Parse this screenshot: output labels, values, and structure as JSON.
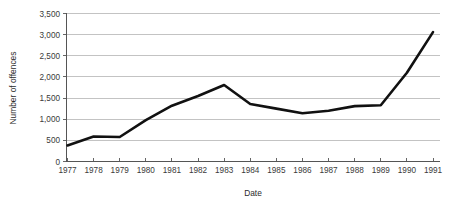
{
  "chart_data": {
    "type": "line",
    "title": "",
    "xlabel": "Date",
    "ylabel": "Number of offences",
    "categories": [
      "1977",
      "1978",
      "1979",
      "1980",
      "1981",
      "1982",
      "1983",
      "1984",
      "1985",
      "1986",
      "1987",
      "1988",
      "1989",
      "1990",
      "1991"
    ],
    "values": [
      380,
      590,
      580,
      980,
      1320,
      1550,
      1810,
      1360,
      1250,
      1140,
      1200,
      1310,
      1330,
      2100,
      3060
    ],
    "series": [
      {
        "name": "Number of offences",
        "values": [
          380,
          590,
          580,
          980,
          1320,
          1550,
          1810,
          1360,
          1250,
          1140,
          1200,
          1310,
          1330,
          2100,
          3060
        ]
      }
    ],
    "ylim": [
      0,
      3500
    ],
    "ytick_values": [
      0,
      500,
      1000,
      1500,
      2000,
      2500,
      3000,
      3500
    ],
    "ytick_labels": [
      "0",
      "500",
      "1,000",
      "1,500",
      "2,000",
      "2,500",
      "3,000",
      "3,500"
    ],
    "xtick_labels": [
      "1977",
      "1978",
      "1979",
      "1980",
      "1981",
      "1982",
      "1983",
      "1984",
      "1985",
      "1986",
      "1987",
      "1988",
      "1989",
      "1990",
      "1991"
    ],
    "grid": true,
    "grid_orientation": "horizontal",
    "legend": false,
    "legend_position": "none",
    "line_color": "#111111",
    "grid_color": "#a9a9a9",
    "axis_color": "#555555",
    "background_color": "#ffffff"
  }
}
